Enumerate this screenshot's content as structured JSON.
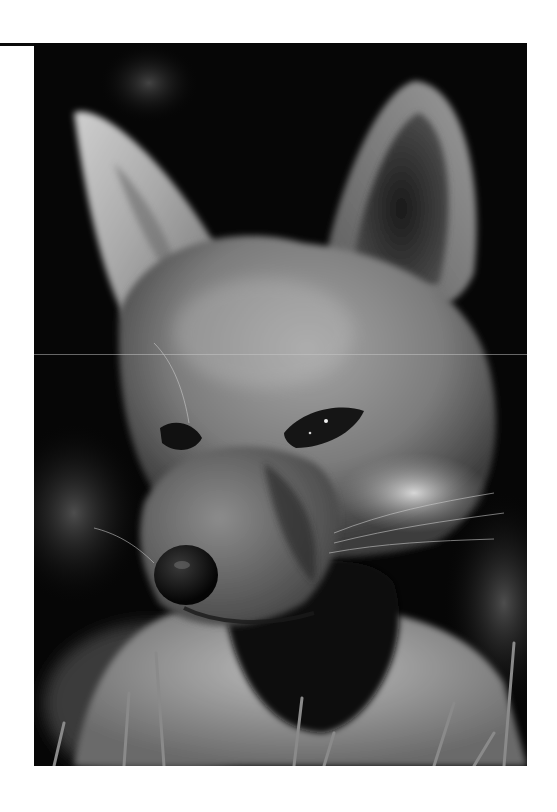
{
  "page": {
    "background_color": "#ffffff",
    "rule_color": "#0b0b0b"
  },
  "photo": {
    "subject": "fox portrait",
    "description": "Black-and-white close-up photograph of a young fox facing slightly left, large upright ears, dark background, grass blades in the foreground",
    "color_mode": "grayscale",
    "tones": {
      "background": "#060606",
      "fur_mid": "#8a8a8a",
      "fur_light": "#d8d8d8",
      "fur_dark": "#3a3a3a",
      "nose": "#0a0a0a",
      "eye": "#151515"
    }
  }
}
